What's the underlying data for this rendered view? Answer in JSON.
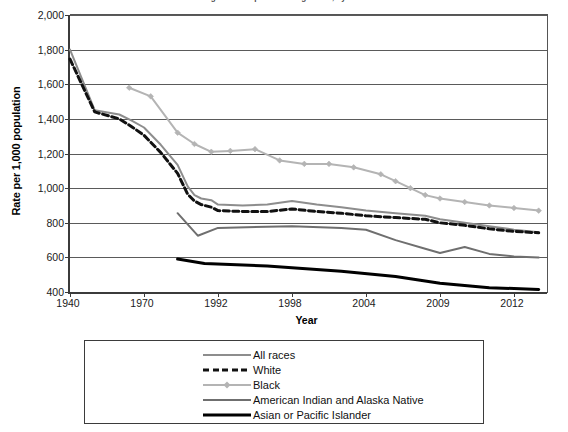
{
  "figure": {
    "title": "Figure 2. Hospital discharge rates, by race",
    "x_axis_label": "Year",
    "y_axis_label": "Rate per 1,000 population"
  },
  "colors": {
    "all_races": "#8d8d8d",
    "white": "#111111",
    "black": "#b4b4b4",
    "american_indian": "#6f6f6f",
    "asian_pacific": "#000000",
    "axis": "#3b3b3b",
    "gridline": "#5a5a5a",
    "background": "#ffffff"
  },
  "legend": {
    "items": [
      {
        "label": "All races",
        "style": "solid",
        "color": "#8d8d8d",
        "width": 2,
        "marker": "none"
      },
      {
        "label": "White",
        "style": "dashed",
        "color": "#111111",
        "width": 3,
        "marker": "none"
      },
      {
        "label": "Black",
        "style": "solid",
        "color": "#b4b4b4",
        "width": 2,
        "marker": "diamond"
      },
      {
        "label": "American Indian and Alaska Native",
        "style": "solid",
        "color": "#6f6f6f",
        "width": 2,
        "marker": "none"
      },
      {
        "label": "Asian or Pacific Islander",
        "style": "solid",
        "color": "#000000",
        "width": 3,
        "marker": "none"
      }
    ]
  },
  "chart_data": {
    "type": "line",
    "title": "Figure 2. Hospital discharge rates, by race",
    "xlabel": "Year",
    "ylabel": "Rate per 1,000 population",
    "grid": true,
    "legend_position": "bottom",
    "xlim": [
      1940,
      2014
    ],
    "ylim": [
      400,
      2000
    ],
    "ytick_labels": [
      "2,000",
      "1,800",
      "1,600",
      "1,400",
      "1,200",
      "1,000",
      "800",
      "600",
      "400"
    ],
    "ytick_values": [
      2000,
      1800,
      1600,
      1400,
      1200,
      1000,
      800,
      600,
      400
    ],
    "xtick_labels": [
      "1940",
      "1970",
      "1992",
      "1998",
      "2004",
      "2009",
      "2012"
    ],
    "xtick_values": [
      1940,
      1970,
      1992,
      1998,
      2004,
      2009,
      2012
    ],
    "note": "x-axis uses an unevenly-spaced categorical scale; ticks are evenly spaced in pixels",
    "series": [
      {
        "name": "All races",
        "color": "#8d8d8d",
        "x": [
          1940,
          1950,
          1960,
          1965,
          1970,
          1975,
          1980,
          1983,
          1985,
          1987,
          1990,
          1992,
          1994,
          1996,
          1998,
          2000,
          2002,
          2004,
          2006,
          2008,
          2009,
          2010,
          2011,
          2012,
          2013
        ],
        "values": [
          1800,
          1450,
          1425,
          1390,
          1350,
          1250,
          1135,
          1010,
          960,
          940,
          930,
          905,
          900,
          905,
          925,
          905,
          890,
          870,
          855,
          840,
          820,
          800,
          780,
          760,
          745
        ]
      },
      {
        "name": "White",
        "color": "#111111",
        "x": [
          1940,
          1950,
          1960,
          1965,
          1970,
          1975,
          1980,
          1983,
          1985,
          1987,
          1990,
          1992,
          1994,
          1996,
          1998,
          2000,
          2002,
          2004,
          2006,
          2008,
          2009,
          2010,
          2011,
          2012,
          2013
        ],
        "values": [
          1745,
          1440,
          1400,
          1355,
          1305,
          1205,
          1085,
          965,
          925,
          905,
          890,
          870,
          865,
          865,
          880,
          865,
          855,
          840,
          830,
          820,
          800,
          785,
          765,
          750,
          742
        ]
      },
      {
        "name": "Black",
        "color": "#b4b4b4",
        "x": [
          1964,
          1972,
          1980,
          1985,
          1990,
          1993,
          1995,
          1997,
          1999,
          2001,
          2003,
          2005,
          2006,
          2007,
          2008,
          2009,
          2010,
          2011,
          2012,
          2013
        ],
        "values": [
          1580,
          1530,
          1320,
          1255,
          1210,
          1215,
          1225,
          1160,
          1140,
          1140,
          1120,
          1080,
          1040,
          1000,
          960,
          940,
          920,
          900,
          885,
          870
        ]
      },
      {
        "name": "American Indian and Alaska Native",
        "color": "#6f6f6f",
        "x": [
          1980,
          1986,
          1992,
          1998,
          2002,
          2004,
          2006,
          2008,
          2009,
          2010,
          2011,
          2012,
          2013
        ],
        "values": [
          855,
          725,
          770,
          780,
          770,
          760,
          700,
          650,
          625,
          660,
          620,
          605,
          600
        ]
      },
      {
        "name": "Asian or Pacific Islander",
        "color": "#000000",
        "x": [
          1980,
          1988,
          1996,
          2002,
          2006,
          2009,
          2011,
          2013
        ],
        "values": [
          590,
          565,
          550,
          520,
          490,
          450,
          425,
          415
        ]
      }
    ]
  }
}
